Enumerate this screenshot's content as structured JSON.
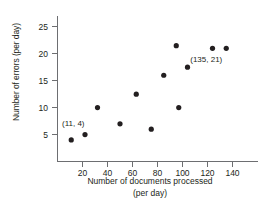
{
  "chart_data": {
    "type": "scatter",
    "title": "",
    "xlabel": "Number of documents processed (per day)",
    "xlabel_line1": "Number of documents processed",
    "xlabel_line2": "(per day)",
    "ylabel": "Number of errors (per day)",
    "xlim": [
      0,
      148
    ],
    "ylim": [
      0,
      27
    ],
    "xticks": [
      20,
      40,
      60,
      80,
      100,
      120,
      140
    ],
    "yticks": [
      5,
      10,
      15,
      20,
      25
    ],
    "grid": false,
    "legend": false,
    "marker": "filled-circle",
    "marker_color": "#231f20",
    "points": [
      {
        "x": 11,
        "y": 4
      },
      {
        "x": 22,
        "y": 5
      },
      {
        "x": 32,
        "y": 10
      },
      {
        "x": 50,
        "y": 7
      },
      {
        "x": 63,
        "y": 12.5
      },
      {
        "x": 75,
        "y": 6
      },
      {
        "x": 85,
        "y": 16
      },
      {
        "x": 95,
        "y": 21.5
      },
      {
        "x": 97,
        "y": 10
      },
      {
        "x": 104,
        "y": 17.5
      },
      {
        "x": 124,
        "y": 21
      },
      {
        "x": 135,
        "y": 21
      }
    ],
    "annotations": [
      {
        "text": "(11, 4)",
        "x": 11,
        "y": 4,
        "dx": 2,
        "dy": -14
      },
      {
        "text": "(135, 21)",
        "x": 135,
        "y": 21,
        "dx": -20,
        "dy": 14
      }
    ]
  }
}
